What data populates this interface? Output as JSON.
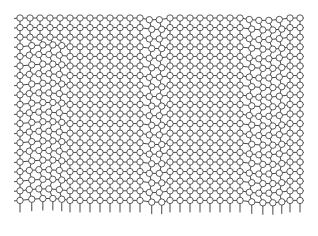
{
  "diagram": {
    "type": "lattice",
    "grid": {
      "x0": 20,
      "y0": 18,
      "cols": 29,
      "rows": 20,
      "dx": 10,
      "dy": 9.6,
      "node_radius": 3.2
    },
    "line_extension": {
      "left": 6,
      "right": 4,
      "top": 3,
      "bottom": 12
    },
    "distortion_bands": [
      {
        "axis": "x",
        "from_col": 0,
        "to_col": 5,
        "row_from": 3,
        "row_to": 20,
        "shift_x": 3,
        "shift_y": -2
      },
      {
        "axis": "x",
        "from_col": 12,
        "to_col": 15,
        "row_from": 0,
        "row_to": 20,
        "shift_x": 2,
        "shift_y": 2
      },
      {
        "axis": "x",
        "from_col": 22,
        "to_col": 27,
        "row_from": 0,
        "row_to": 20,
        "shift_x": 3,
        "shift_y": 2.5
      }
    ],
    "colors": {
      "line": "#333333",
      "node_fill": "#ffffff",
      "node_stroke": "#333333",
      "background": "#ffffff"
    }
  }
}
